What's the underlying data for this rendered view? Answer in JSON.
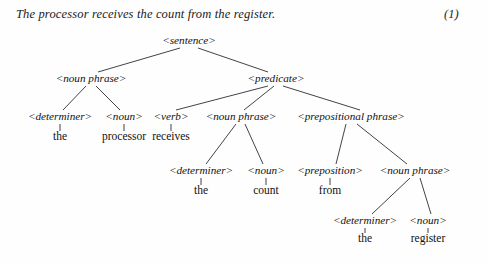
{
  "caption": {
    "text": "The processor receives the count from the register.",
    "equation_number": "(1)"
  },
  "tree": {
    "nodes": {
      "sentence": {
        "label": "<sentence>",
        "x": 189,
        "y": 44
      },
      "np_subject": {
        "label": "<noun phrase>",
        "x": 91,
        "y": 82
      },
      "predicate": {
        "label": "<predicate>",
        "x": 276,
        "y": 82
      },
      "det_the_1": {
        "label": "<determiner>",
        "x": 60,
        "y": 120
      },
      "noun_processor": {
        "label": "<noun>",
        "x": 124,
        "y": 120
      },
      "verb_receives": {
        "label": "<verb>",
        "x": 171,
        "y": 120
      },
      "np_object": {
        "label": "<noun phrase>",
        "x": 241,
        "y": 120
      },
      "pp": {
        "label": "<prepositional phrase>",
        "x": 351,
        "y": 120
      },
      "det_the_2": {
        "label": "<determiner>",
        "x": 201,
        "y": 174
      },
      "noun_count": {
        "label": "<noun>",
        "x": 266,
        "y": 174
      },
      "prep_from": {
        "label": "<preposition>",
        "x": 330,
        "y": 174
      },
      "np_prep_object": {
        "label": "<noun phrase>",
        "x": 415,
        "y": 174
      },
      "det_the_3": {
        "label": "<determiner>",
        "x": 365,
        "y": 224
      },
      "noun_register": {
        "label": "<noun>",
        "x": 428,
        "y": 224
      }
    },
    "terminals": {
      "the_1": {
        "label": "the",
        "x": 60,
        "y": 140,
        "stem_from_y": 124
      },
      "processor": {
        "label": "processor",
        "x": 124,
        "y": 140,
        "stem_from_y": 124
      },
      "receives": {
        "label": "receives",
        "x": 171,
        "y": 140,
        "stem_from_y": 124
      },
      "the_2": {
        "label": "the",
        "x": 201,
        "y": 194,
        "stem_from_y": 178
      },
      "count": {
        "label": "count",
        "x": 266,
        "y": 194,
        "stem_from_y": 178
      },
      "from": {
        "label": "from",
        "x": 330,
        "y": 194,
        "stem_from_y": 178
      },
      "the_3": {
        "label": "the",
        "x": 365,
        "y": 242,
        "stem_from_y": 228
      },
      "register": {
        "label": "register",
        "x": 428,
        "y": 242,
        "stem_from_y": 228
      }
    },
    "edges": [
      {
        "from": "sentence",
        "to": "np_subject",
        "x1": 180,
        "y1": 48,
        "x2": 98,
        "y2": 72
      },
      {
        "from": "sentence",
        "to": "predicate",
        "x1": 198,
        "y1": 48,
        "x2": 268,
        "y2": 72
      },
      {
        "from": "np_subject",
        "to": "det_the_1",
        "x1": 86,
        "y1": 86,
        "x2": 63,
        "y2": 110
      },
      {
        "from": "np_subject",
        "to": "noun_processor",
        "x1": 96,
        "y1": 86,
        "x2": 120,
        "y2": 110
      },
      {
        "from": "predicate",
        "to": "verb_receives",
        "x1": 268,
        "y1": 86,
        "x2": 176,
        "y2": 110
      },
      {
        "from": "predicate",
        "to": "np_object",
        "x1": 274,
        "y1": 86,
        "x2": 244,
        "y2": 110
      },
      {
        "from": "predicate",
        "to": "pp",
        "x1": 283,
        "y1": 86,
        "x2": 360,
        "y2": 110
      },
      {
        "from": "np_object",
        "to": "det_the_2",
        "x1": 236,
        "y1": 124,
        "x2": 206,
        "y2": 164
      },
      {
        "from": "np_object",
        "to": "noun_count",
        "x1": 245,
        "y1": 124,
        "x2": 263,
        "y2": 164
      },
      {
        "from": "pp",
        "to": "prep_from",
        "x1": 346,
        "y1": 124,
        "x2": 336,
        "y2": 164
      },
      {
        "from": "pp",
        "to": "np_prep_object",
        "x1": 357,
        "y1": 124,
        "x2": 407,
        "y2": 164
      },
      {
        "from": "np_prep_object",
        "to": "det_the_3",
        "x1": 410,
        "y1": 178,
        "x2": 372,
        "y2": 214
      },
      {
        "from": "np_prep_object",
        "to": "noun_register",
        "x1": 420,
        "y1": 178,
        "x2": 431,
        "y2": 214
      }
    ]
  }
}
